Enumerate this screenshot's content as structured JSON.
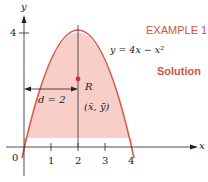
{
  "header": {
    "example_label": "EXAMPLE 1",
    "solution_label": "Solution"
  },
  "figure": {
    "equation": "y = 4x − x²",
    "region_label": "R",
    "centroid_label": "(x̄, ȳ)",
    "distance_label": "d = 2",
    "y_axis_label": "y",
    "x_axis_label": "x",
    "origin_label": "0",
    "y_tick_label": "4",
    "x_tick_labels": [
      "1",
      "2",
      "3",
      "4"
    ]
  },
  "colors": {
    "accent": "#d0543f",
    "curve": "#e0564a",
    "fill": "#f6c9c2",
    "axis": "#222222"
  }
}
